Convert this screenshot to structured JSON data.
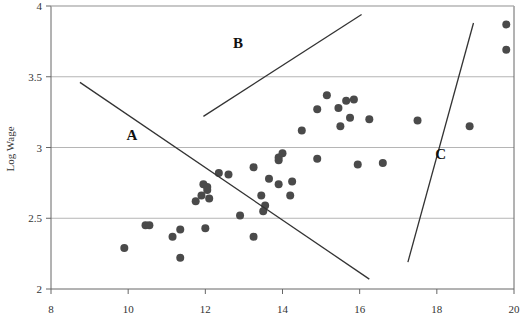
{
  "chart_data": {
    "type": "scatter",
    "title": "",
    "xlabel": "",
    "ylabel": "Log Wage",
    "xlim": [
      8,
      20
    ],
    "ylim": [
      2,
      4
    ],
    "x_ticks": [
      8,
      10,
      12,
      14,
      16,
      18,
      20
    ],
    "x_tick_labels": [
      "8",
      "10",
      "12",
      "14",
      "16",
      "18",
      "20"
    ],
    "y_ticks": [
      2,
      2.5,
      3,
      3.5,
      4
    ],
    "y_tick_labels": [
      "2",
      "2.5",
      "3",
      "3.5",
      "4"
    ],
    "grid": {
      "horizontal": true,
      "vertical": false
    },
    "legend": null,
    "marker_color": "#4a4a4a",
    "line_color": "#333333",
    "grid_color": "#b5b5b5",
    "series": [
      {
        "name": "observations",
        "points": [
          [
            9.9,
            2.29
          ],
          [
            10.45,
            2.45
          ],
          [
            10.55,
            2.45
          ],
          [
            11.15,
            2.37
          ],
          [
            11.35,
            2.42
          ],
          [
            11.35,
            2.22
          ],
          [
            11.75,
            2.62
          ],
          [
            11.9,
            2.66
          ],
          [
            11.95,
            2.74
          ],
          [
            12.05,
            2.72
          ],
          [
            12.05,
            2.7
          ],
          [
            12.1,
            2.64
          ],
          [
            12.0,
            2.43
          ],
          [
            12.35,
            2.82
          ],
          [
            12.6,
            2.81
          ],
          [
            12.9,
            2.52
          ],
          [
            13.25,
            2.86
          ],
          [
            13.25,
            2.37
          ],
          [
            13.45,
            2.66
          ],
          [
            13.55,
            2.59
          ],
          [
            13.5,
            2.55
          ],
          [
            13.65,
            2.78
          ],
          [
            13.9,
            2.93
          ],
          [
            14.0,
            2.96
          ],
          [
            13.9,
            2.91
          ],
          [
            13.9,
            2.74
          ],
          [
            14.25,
            2.76
          ],
          [
            14.2,
            2.66
          ],
          [
            14.5,
            3.12
          ],
          [
            14.9,
            3.27
          ],
          [
            14.9,
            2.92
          ],
          [
            15.15,
            3.37
          ],
          [
            15.45,
            3.28
          ],
          [
            15.5,
            3.15
          ],
          [
            15.65,
            3.33
          ],
          [
            15.85,
            3.34
          ],
          [
            15.75,
            3.21
          ],
          [
            15.95,
            2.88
          ],
          [
            16.25,
            3.2
          ],
          [
            16.6,
            2.89
          ],
          [
            17.5,
            3.19
          ],
          [
            18.85,
            3.15
          ],
          [
            19.8,
            3.69
          ],
          [
            19.8,
            3.87
          ]
        ]
      }
    ],
    "lines": [
      {
        "label": "A",
        "from": [
          8.75,
          3.46
        ],
        "to": [
          16.25,
          2.07
        ],
        "label_pos": [
          10.1,
          3.05
        ]
      },
      {
        "label": "B",
        "from": [
          11.95,
          3.22
        ],
        "to": [
          16.05,
          3.94
        ],
        "label_pos": [
          12.85,
          3.7
        ]
      },
      {
        "label": "C",
        "from": [
          17.25,
          2.19
        ],
        "to": [
          18.95,
          3.88
        ],
        "label_pos": [
          18.1,
          2.92
        ]
      }
    ]
  }
}
